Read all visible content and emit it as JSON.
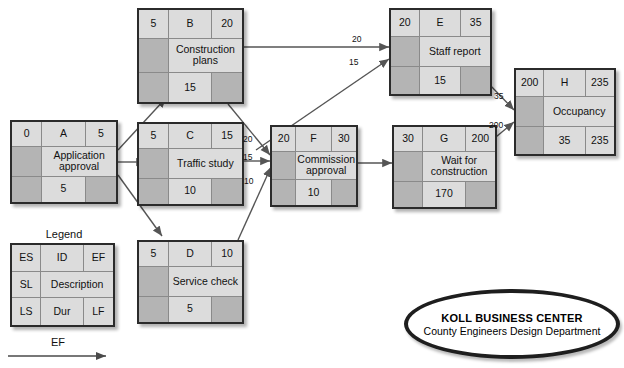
{
  "diagram": {
    "title_block": {
      "line1": "KOLL BUSINESS CENTER",
      "line2": "County Engineers Design Department"
    },
    "legend": {
      "title": "Legend",
      "cells": {
        "es": "ES",
        "id": "ID",
        "ef": "EF",
        "sl": "SL",
        "description": "Description",
        "ls": "LS",
        "dur": "Dur",
        "lf": "LF"
      }
    },
    "scale": {
      "label": "EF"
    },
    "colors": {
      "node_fill_light": "#dcdcdc",
      "node_fill_dark": "#b4b4b4",
      "node_border": "#2b2b2b",
      "edge": "#555555",
      "page_bg": "#ffffff"
    },
    "nodes": [
      {
        "key": "A",
        "id": "A",
        "es": "0",
        "ef": "5",
        "description": "Application approval",
        "sl": "",
        "ls": "",
        "dur": "5",
        "lf": ""
      },
      {
        "key": "B",
        "id": "B",
        "es": "5",
        "ef": "20",
        "description": "Construction plans",
        "sl": "",
        "ls": "",
        "dur": "15",
        "lf": ""
      },
      {
        "key": "C",
        "id": "C",
        "es": "5",
        "ef": "15",
        "description": "Traffic study",
        "sl": "",
        "ls": "",
        "dur": "10",
        "lf": ""
      },
      {
        "key": "D",
        "id": "D",
        "es": "5",
        "ef": "10",
        "description": "Service check",
        "sl": "",
        "ls": "",
        "dur": "5",
        "lf": ""
      },
      {
        "key": "E",
        "id": "E",
        "es": "20",
        "ef": "35",
        "description": "Staff report",
        "sl": "",
        "ls": "",
        "dur": "15",
        "lf": ""
      },
      {
        "key": "F",
        "id": "F",
        "es": "20",
        "ef": "30",
        "description": "Commission approval",
        "sl": "",
        "ls": "",
        "dur": "10",
        "lf": ""
      },
      {
        "key": "G",
        "id": "G",
        "es": "30",
        "ef": "200",
        "description": "Wait for construction",
        "sl": "",
        "ls": "",
        "dur": "170",
        "lf": ""
      },
      {
        "key": "H",
        "id": "H",
        "es": "200",
        "ef": "235",
        "description": "Occupancy",
        "sl": "",
        "ls": "",
        "dur": "35",
        "lf": "235"
      }
    ],
    "edges": [
      {
        "from": "A",
        "to": "B",
        "label": ""
      },
      {
        "from": "A",
        "to": "C",
        "label": ""
      },
      {
        "from": "A",
        "to": "D",
        "label": ""
      },
      {
        "from": "B",
        "to": "E",
        "label": "20"
      },
      {
        "from": "C",
        "to": "E",
        "label": "15"
      },
      {
        "from": "B",
        "to": "F",
        "label": "20"
      },
      {
        "from": "C",
        "to": "F",
        "label": "15"
      },
      {
        "from": "D",
        "to": "F",
        "label": "10"
      },
      {
        "from": "F",
        "to": "G",
        "label": ""
      },
      {
        "from": "E",
        "to": "H",
        "label": "35"
      },
      {
        "from": "G",
        "to": "H",
        "label": "200"
      }
    ]
  }
}
